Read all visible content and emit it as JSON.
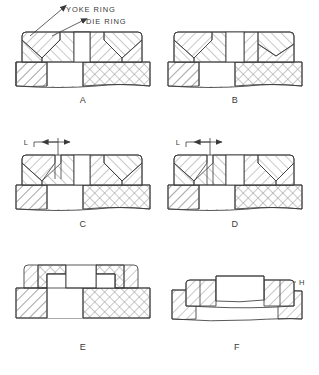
{
  "drawing": {
    "title_annotations": [
      {
        "id": "yoke-ring",
        "text": "YOKE  RING"
      },
      {
        "id": "die-ring",
        "text": "DIE  RING"
      }
    ],
    "figures": [
      {
        "id": "a",
        "caption": "A",
        "callout": null
      },
      {
        "id": "b",
        "caption": "B",
        "callout": null
      },
      {
        "id": "c",
        "caption": "C",
        "callout": "L"
      },
      {
        "id": "d",
        "caption": "D",
        "callout": "L"
      },
      {
        "id": "e",
        "caption": "E",
        "callout": null
      },
      {
        "id": "f",
        "caption": "F",
        "callout": "H"
      }
    ],
    "colors": {
      "outline": "#3a3a3a",
      "hatch": "#9a9a9a",
      "background": "#ffffff"
    }
  }
}
